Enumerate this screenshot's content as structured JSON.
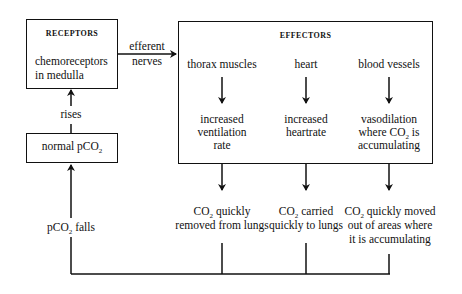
{
  "diagram": {
    "receptors": {
      "heading": "RECEPTORS",
      "line1": "chemoreceptors",
      "line2": "in medulla"
    },
    "efferent_arrow": {
      "line1": "efferent",
      "line2": "nerves"
    },
    "effectors": {
      "heading": "EFFECTORS",
      "items": [
        {
          "name": "thorax muscles",
          "response_line1": "increased",
          "response_line2": "ventilation",
          "response_line3": "rate"
        },
        {
          "name": "heart",
          "response_line1": "increased",
          "response_line2": "heartrate",
          "response_line3": ""
        },
        {
          "name": "blood vessels",
          "response_line1": "vasodilation",
          "response_line2_pre": "where CO",
          "response_line2_sub": "2",
          "response_line2_post": " is",
          "response_line3": "accumulating"
        }
      ]
    },
    "outcomes": [
      {
        "line1_pre": "CO",
        "line1_sub": "2",
        "line1_post": " quickly",
        "line2": "removed from lungs",
        "line3": ""
      },
      {
        "line1_pre": "CO",
        "line1_sub": "2",
        "line1_post": " carried",
        "line2": "quickly to lungs",
        "line3": ""
      },
      {
        "line1_pre": "CO",
        "line1_sub": "2",
        "line1_post": " quickly moved",
        "line2": "out of areas where",
        "line3": "it is accumulating"
      }
    ],
    "normal_box": {
      "pre": "normal pCO",
      "sub": "2"
    },
    "rises_label": "rises",
    "falls_label": {
      "pre": "pCO",
      "sub": "2",
      "post": " falls"
    }
  }
}
